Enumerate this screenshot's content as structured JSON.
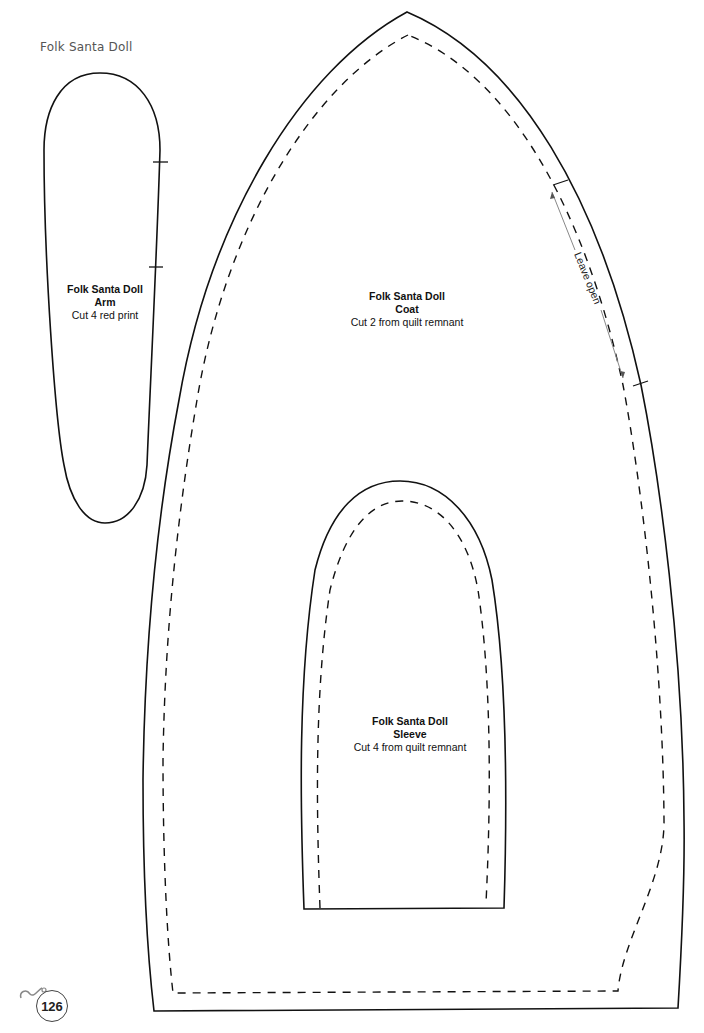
{
  "page": {
    "header": "Folk Santa Doll",
    "page_number": "126"
  },
  "pieces": {
    "arm": {
      "title": "Folk Santa Doll",
      "subtitle": "Arm",
      "instruction": "Cut 4 red print"
    },
    "coat": {
      "title": "Folk Santa Doll",
      "subtitle": "Coat",
      "instruction": "Cut 2 from quilt remnant",
      "annotation": "Leave open"
    },
    "sleeve": {
      "title": "Folk Santa Doll",
      "subtitle": "Sleeve",
      "instruction": "Cut 4 from quilt remnant"
    }
  },
  "colors": {
    "line": "#111111",
    "annotation_line": "#888888",
    "header_text": "#555555"
  }
}
